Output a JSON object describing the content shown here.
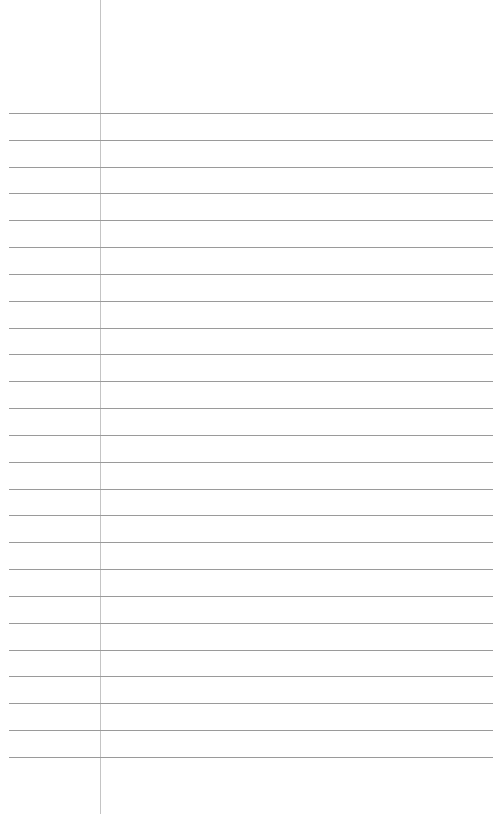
{
  "page": {
    "type": "lined-notebook-page",
    "background": "#ffffff",
    "margin_line": {
      "x": 100,
      "color": "#c4c4c4"
    },
    "rules": {
      "count": 25,
      "first_y": 113,
      "spacing": 26.83,
      "x_start": 9,
      "x_end": 493,
      "color": "#9a9a9a"
    },
    "content_text": ""
  }
}
